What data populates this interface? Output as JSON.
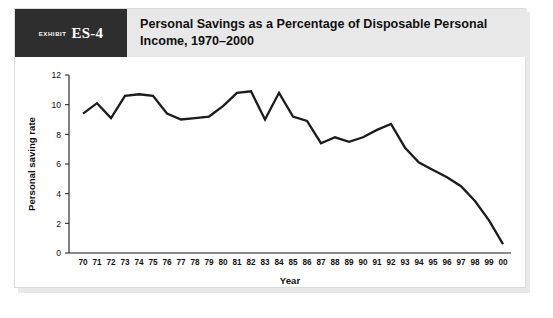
{
  "exhibit": {
    "label": "exhibit",
    "number": "ES-4"
  },
  "header": {
    "title": "Personal Savings as a Percentage of Disposable Personal Income, 1970–2000"
  },
  "chart_data": {
    "type": "line",
    "title": "Personal Savings as a Percentage of Disposable Personal Income, 1970–2000",
    "xlabel": "Year",
    "ylabel": "Personal saving rate",
    "xlim": [
      0,
      30
    ],
    "ylim": [
      0,
      12
    ],
    "yticks": [
      0,
      2,
      4,
      6,
      8,
      10,
      12
    ],
    "grid": false,
    "legend": false,
    "categories": [
      "70",
      "71",
      "72",
      "73",
      "74",
      "75",
      "76",
      "77",
      "78",
      "79",
      "80",
      "81",
      "82",
      "83",
      "84",
      "85",
      "86",
      "87",
      "88",
      "89",
      "90",
      "91",
      "92",
      "93",
      "94",
      "95",
      "96",
      "97",
      "98",
      "99",
      "00"
    ],
    "values": [
      9.4,
      10.1,
      9.1,
      10.6,
      10.7,
      10.6,
      9.4,
      9.0,
      9.1,
      9.2,
      9.9,
      10.8,
      10.9,
      9.0,
      10.8,
      9.2,
      8.9,
      7.4,
      7.8,
      7.5,
      7.8,
      8.3,
      8.7,
      7.1,
      6.1,
      5.6,
      5.1,
      4.5,
      3.5,
      2.2,
      0.6
    ],
    "series": [
      {
        "name": "Personal saving rate",
        "values": [
          9.4,
          10.1,
          9.1,
          10.6,
          10.7,
          10.6,
          9.4,
          9.0,
          9.1,
          9.2,
          9.9,
          10.8,
          10.9,
          9.0,
          10.8,
          9.2,
          8.9,
          7.4,
          7.8,
          7.5,
          7.8,
          8.3,
          8.7,
          7.1,
          6.1,
          5.6,
          5.1,
          4.5,
          3.5,
          2.2,
          0.6
        ],
        "color": "#1c1c1c"
      }
    ]
  },
  "colors": {
    "badge_background": "#2e2e2e",
    "header_background": "#e8e8e8",
    "line": "#1c1c1c",
    "axis": "#1a1a1a",
    "card_border": "#dcdcdc"
  }
}
